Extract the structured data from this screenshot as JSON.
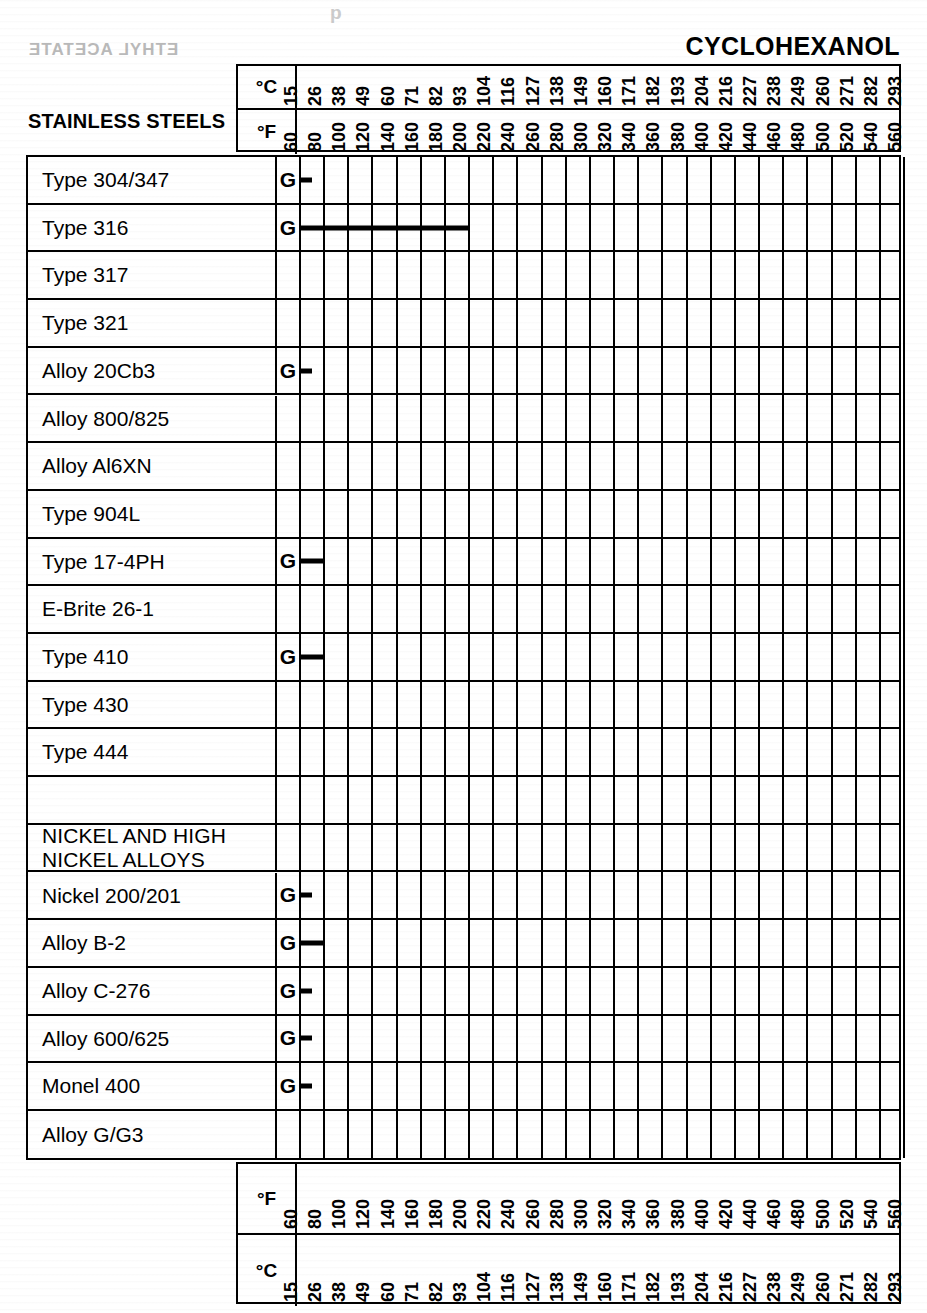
{
  "title": "CYCLOHEXANOL",
  "ghost_text": {
    "bleed_left": "ETHYL ACETATE",
    "bleed_top": "p"
  },
  "axis": {
    "unit_c": "°C",
    "unit_f": "°F",
    "celsius": [
      15,
      26,
      38,
      49,
      60,
      71,
      82,
      93,
      104,
      116,
      127,
      138,
      149,
      160,
      171,
      182,
      193,
      204,
      216,
      227,
      238,
      249,
      260,
      271,
      282,
      293
    ],
    "fahrenheit": [
      60,
      80,
      100,
      120,
      140,
      160,
      180,
      200,
      220,
      240,
      260,
      280,
      300,
      320,
      340,
      360,
      380,
      400,
      420,
      440,
      460,
      480,
      500,
      520,
      540,
      560
    ]
  },
  "sections": {
    "stainless": "STAINLESS STEELS",
    "nickel": "NICKEL AND HIGH\nNICKEL ALLOYS"
  },
  "chart_data": {
    "type": "bar",
    "title": "CYCLOHEXANOL",
    "xlabel": "Temperature",
    "ylabel": "Alloy",
    "grid": true,
    "legend": "none",
    "x_axis_top_primary": "°C",
    "x_axis_top_secondary": "°F",
    "x_ticks_c": [
      15,
      26,
      38,
      49,
      60,
      71,
      82,
      93,
      104,
      116,
      127,
      138,
      149,
      160,
      171,
      182,
      193,
      204,
      216,
      227,
      238,
      249,
      260,
      271,
      282,
      293
    ],
    "x_ticks_f": [
      60,
      80,
      100,
      120,
      140,
      160,
      180,
      200,
      220,
      240,
      260,
      280,
      300,
      320,
      340,
      360,
      380,
      400,
      420,
      440,
      460,
      480,
      500,
      520,
      540,
      560
    ],
    "xlim_f": [
      60,
      560
    ],
    "categories": [
      "Type 304/347",
      "Type 316",
      "Type 317",
      "Type 321",
      "Alloy 20Cb3",
      "Alloy 800/825",
      "Alloy Al6XN",
      "Type 904L",
      "Type 17-4PH",
      "E-Brite 26-1",
      "Type 410",
      "Type 430",
      "Type 444",
      "",
      "NICKEL AND HIGH NICKEL ALLOYS",
      "Nickel 200/201",
      "Alloy B-2",
      "Alloy C-276",
      "Alloy 600/625",
      "Monel 400",
      "Alloy G/G3"
    ],
    "ratings": [
      "G",
      "G",
      "",
      "",
      "G",
      "",
      "",
      "",
      "G",
      "",
      "G",
      "",
      "",
      "",
      "",
      "G",
      "G",
      "G",
      "G",
      "G",
      ""
    ],
    "values_max_f": [
      70,
      200,
      null,
      null,
      70,
      null,
      null,
      null,
      80,
      null,
      80,
      null,
      null,
      null,
      null,
      70,
      80,
      70,
      70,
      70,
      null
    ],
    "note": "Horizontal bar length indicates the maximum service temperature (°F) for which the alloy is rated 'G' (good/satisfactory) in cyclohexanol. Blank rows have no rating data."
  },
  "rows": [
    {
      "label": "Type 304/347",
      "rating": "G",
      "bar_end_f": 70,
      "type": "alloy"
    },
    {
      "label": "Type 316",
      "rating": "G",
      "bar_end_f": 200,
      "type": "alloy"
    },
    {
      "label": "Type 317",
      "rating": "",
      "bar_end_f": null,
      "type": "alloy"
    },
    {
      "label": "Type 321",
      "rating": "",
      "bar_end_f": null,
      "type": "alloy"
    },
    {
      "label": "Alloy 20Cb3",
      "rating": "G",
      "bar_end_f": 70,
      "type": "alloy"
    },
    {
      "label": "Alloy 800/825",
      "rating": "",
      "bar_end_f": null,
      "type": "alloy"
    },
    {
      "label": "Alloy Al6XN",
      "rating": "",
      "bar_end_f": null,
      "type": "alloy"
    },
    {
      "label": "Type 904L",
      "rating": "",
      "bar_end_f": null,
      "type": "alloy"
    },
    {
      "label": "Type 17-4PH",
      "rating": "G",
      "bar_end_f": 80,
      "type": "alloy"
    },
    {
      "label": "E-Brite 26-1",
      "rating": "",
      "bar_end_f": null,
      "type": "alloy"
    },
    {
      "label": "Type 410",
      "rating": "G",
      "bar_end_f": 80,
      "type": "alloy"
    },
    {
      "label": "Type 430",
      "rating": "",
      "bar_end_f": null,
      "type": "alloy"
    },
    {
      "label": "Type 444",
      "rating": "",
      "bar_end_f": null,
      "type": "alloy"
    },
    {
      "label": "",
      "rating": "",
      "bar_end_f": null,
      "type": "spacer"
    },
    {
      "label": "NICKEL AND HIGH\nNICKEL ALLOYS",
      "rating": "",
      "bar_end_f": null,
      "type": "section"
    },
    {
      "label": "Nickel 200/201",
      "rating": "G",
      "bar_end_f": 70,
      "type": "alloy"
    },
    {
      "label": "Alloy B-2",
      "rating": "G",
      "bar_end_f": 80,
      "type": "alloy"
    },
    {
      "label": "Alloy C-276",
      "rating": "G",
      "bar_end_f": 70,
      "type": "alloy"
    },
    {
      "label": "Alloy 600/625",
      "rating": "G",
      "bar_end_f": 70,
      "type": "alloy"
    },
    {
      "label": "Monel 400",
      "rating": "G",
      "bar_end_f": 70,
      "type": "alloy"
    },
    {
      "label": "Alloy G/G3",
      "rating": "",
      "bar_end_f": null,
      "type": "alloy"
    }
  ]
}
